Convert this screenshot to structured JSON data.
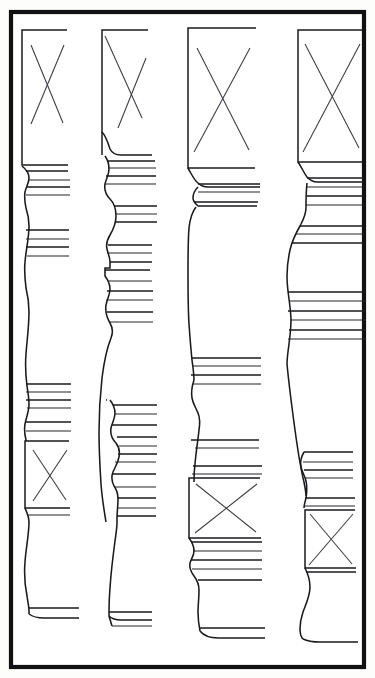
{
  "plate": {
    "title": "Turned Leg Profile Plate",
    "description": "Line drawing plate showing four turned furniture leg profiles in elevation, each with square blocks marked with diagonal cross (X) joinery marks and bands of ring moldings.",
    "background_color": "#fdfdfb",
    "paper_color": "#ffffff",
    "ink_color": "#1a1a1e",
    "frame_color": "#111114",
    "mark_color": "#3a3a40",
    "width": 375,
    "height": 678,
    "frame": {
      "x": 11,
      "y": 12,
      "width": 353,
      "height": 655,
      "stroke_width": 4.2
    }
  },
  "legs": [
    {
      "id": "leg-1",
      "label": "Leg 1",
      "top_block": {
        "x": 22,
        "y": 30,
        "width": 45,
        "height": 135,
        "x_mark": true
      },
      "lower_block": {
        "x": 24,
        "y": 440,
        "width": 44,
        "height": 68,
        "x_mark": true
      },
      "ring_bands": 4,
      "foot": {
        "y": 607,
        "width": 50
      }
    },
    {
      "id": "leg-2",
      "label": "Leg 2",
      "top_block": {
        "x": 102,
        "y": 30,
        "width": 45,
        "height": 100,
        "x_mark": true
      },
      "lower_block": null,
      "ring_bands": 5,
      "foot": {
        "y": 612,
        "width": 42
      }
    },
    {
      "id": "leg-3",
      "label": "Leg 3",
      "top_block": {
        "x": 188,
        "y": 28,
        "width": 67,
        "height": 140,
        "x_mark": true
      },
      "lower_block": {
        "x": 188,
        "y": 475,
        "width": 66,
        "height": 62,
        "x_mark": true
      },
      "ring_bands": 5,
      "foot": {
        "y": 618,
        "width": 70
      }
    },
    {
      "id": "leg-4",
      "label": "Leg 4",
      "top_block": {
        "x": 298,
        "y": 30,
        "width": 66,
        "height": 132,
        "x_mark": true
      },
      "lower_block": {
        "x": 305,
        "y": 505,
        "width": 60,
        "height": 62,
        "x_mark": true
      },
      "ring_bands": 6,
      "foot": {
        "y": 622,
        "width": 58
      }
    }
  ],
  "annotations": {
    "x_mark_meaning": "diagonal cross indicating square (unturned) block section",
    "view": "elevation"
  }
}
